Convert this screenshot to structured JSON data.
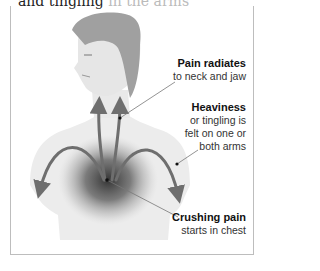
{
  "heading": {
    "visible_text": "and tingling",
    "faded_continuation": "in the arms"
  },
  "figure": {
    "colors": {
      "skin": "#ececec",
      "hair": "#9a9a9a",
      "arrow": "#6e6e6e",
      "pain_center": "#2a2a2a",
      "border": "#bdbdbd",
      "leader_line": "#777777"
    }
  },
  "labels": [
    {
      "title": "Pain radiates",
      "lines": [
        "to neck and jaw"
      ]
    },
    {
      "title": "Heaviness",
      "lines": [
        "or tingling is",
        "felt on one or",
        "both arms"
      ]
    },
    {
      "title": "Crushing pain",
      "lines": [
        "starts in chest"
      ]
    }
  ]
}
